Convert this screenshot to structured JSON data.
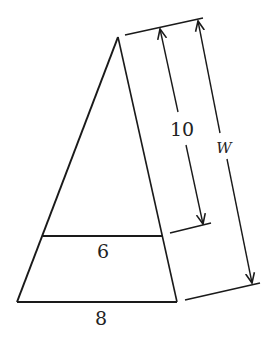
{
  "diagram": {
    "type": "similar-triangles-dimensioned",
    "shape": "triangle with parallel segment",
    "labels": {
      "mid_segment": "6",
      "base": "8",
      "short_height": "10",
      "full_height": "W"
    },
    "colors": {
      "line": "#1a1a1a",
      "background": "#ffffff"
    }
  }
}
